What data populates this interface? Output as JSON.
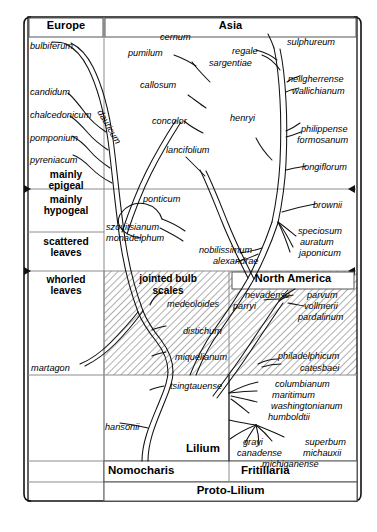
{
  "figure": {
    "type": "diagram"
  },
  "headers": {
    "europe": "Europe",
    "asia": "Asia",
    "north_america": "North America",
    "jointed_bulb_scales": "jointed bulb\nscales",
    "jointed_bulb_scales_l1": "jointed bulb",
    "jointed_bulb_scales_l2": "scales"
  },
  "left_column": {
    "rows": [
      {
        "line1": "mainly",
        "line2": "epigeal"
      },
      {
        "line1": "mainly",
        "line2": "hypogeal"
      },
      {
        "line1": "scattered",
        "line2": "leaves"
      },
      {
        "line1": "whorled",
        "line2": "leaves"
      }
    ]
  },
  "bottom_bands": {
    "lilium": "Lilium",
    "nomocharis": "Nomocharis",
    "fritillaria": "Fritillaria",
    "proto_lilium": "Proto-Lilium"
  },
  "species": {
    "europe": [
      "bulbiferum",
      "candidum",
      "chalcedonicum",
      "pomponium",
      "pyreniacum",
      "martagon"
    ],
    "asia": [
      "cernum",
      "pumilum",
      "regale",
      "sargentiae",
      "sulphureum",
      "callosum",
      "neilgherrense",
      "wallichianum",
      "concolor",
      "henryi",
      "dauricum",
      "lancifolium",
      "philippense",
      "formosanum",
      "longiflorum",
      "ponticum",
      "brownii",
      "szovitsianum",
      "monadelphum",
      "speciosum",
      "auratum",
      "japonicum",
      "nobilissimum",
      "alexandrae",
      "medeoloides",
      "distichum",
      "miquelianum",
      "tsingtauense",
      "hansonii"
    ],
    "north_america": [
      "nevadense",
      "parvum",
      "parryi",
      "vollmerii",
      "pardalinum",
      "philadelphicum",
      "catesbaei",
      "columbianum",
      "maritimum",
      "washingtonianum",
      "humboldtii",
      "grayi",
      "superbum",
      "canadense",
      "michauxii",
      "michiganense"
    ]
  },
  "labels": {
    "bulbiferum": "bulbiferum",
    "candidum": "candidum",
    "chalcedonicum": "chalcedonicum",
    "pomponium": "pomponium",
    "pyreniacum": "pyreniacum",
    "martagon": "martagon",
    "cernum": "cernum",
    "pumilum": "pumilum",
    "regale": "regale",
    "sargentiae": "sargentiae",
    "sulphureum": "sulphureum",
    "callosum": "callosum",
    "neilgherrense": "neilgherrense",
    "wallichianum": "wallichianum",
    "concolor": "concolor",
    "henryi": "henryi",
    "dauricum": "dauricum",
    "lancifolium": "lancifolium",
    "philippense": "philippense",
    "formosanum": "formosanum",
    "longiflorum": "longiflorum",
    "ponticum": "ponticum",
    "brownii": "brownii",
    "szovitsianum": "szovitsianum",
    "monadelphum": "monadelphum",
    "speciosum": "speciosum",
    "auratum": "auratum",
    "japonicum": "japonicum",
    "nobilissimum": "nobilissimum",
    "alexandrae": "alexandrae",
    "medeoloides": "medeoloides",
    "distichum": "distichum",
    "miquelianum": "miquelianum",
    "tsingtauense": "tsingtauense",
    "hansonii": "hansonii",
    "nevadense": "nevadense",
    "parvum": "parvum",
    "parryi": "parryi",
    "vollmerii": "vollmerii",
    "pardalinum": "pardalinum",
    "philadelphicum": "philadelphicum",
    "catesbaei": "catesbaei",
    "columbianum": "columbianum",
    "maritimum": "maritimum",
    "washingtonianum": "washingtonianum",
    "humboldtii": "humboldtii",
    "grayi": "grayi",
    "superbum": "superbum",
    "canadense": "canadense",
    "michauxii": "michauxii",
    "michiganense": "michiganense"
  },
  "colors": {
    "ink": "#000000",
    "rule": "#888888",
    "hatch": "#9a9a9a",
    "background": "#ffffff"
  }
}
